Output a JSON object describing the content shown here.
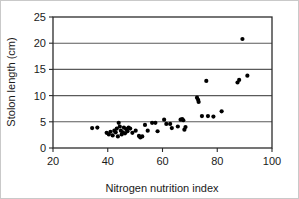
{
  "chart_data": {
    "type": "scatter",
    "title": "",
    "xlabel": "Nitrogen nutrition index",
    "ylabel": "Stolon length (cm)",
    "xlim": [
      20,
      100
    ],
    "ylim": [
      0,
      25
    ],
    "xticks": [
      20,
      40,
      60,
      80,
      100
    ],
    "yticks": [
      0,
      5,
      10,
      15,
      20,
      25
    ],
    "xtick_labels": [
      "20",
      "40",
      "60",
      "80",
      "100"
    ],
    "ytick_labels": [
      "0",
      "5",
      "10",
      "15",
      "20",
      "25"
    ],
    "grid": "horizontal",
    "gridlines_y": [
      5,
      10,
      15,
      20
    ],
    "legend": "none",
    "marker": "filled-circle",
    "marker_color": "#000000",
    "series": [
      {
        "name": "Stolon length vs nitrogen nutrition index",
        "points": [
          [
            34.3,
            3.8
          ],
          [
            36.2,
            3.9
          ],
          [
            39.6,
            2.9
          ],
          [
            40.4,
            2.6
          ],
          [
            41.0,
            3.1
          ],
          [
            41.8,
            2.4
          ],
          [
            42.4,
            3.3
          ],
          [
            42.9,
            3.0
          ],
          [
            43.3,
            3.7
          ],
          [
            43.7,
            2.2
          ],
          [
            44.0,
            4.8
          ],
          [
            44.4,
            4.1
          ],
          [
            44.8,
            3.3
          ],
          [
            45.1,
            2.6
          ],
          [
            45.5,
            3.0
          ],
          [
            45.9,
            3.9
          ],
          [
            46.3,
            2.8
          ],
          [
            46.8,
            3.6
          ],
          [
            47.2,
            3.2
          ],
          [
            47.6,
            3.9
          ],
          [
            48.2,
            3.7
          ],
          [
            49.0,
            2.9
          ],
          [
            50.2,
            3.3
          ],
          [
            51.4,
            2.3
          ],
          [
            51.9,
            2.0
          ],
          [
            52.6,
            2.2
          ],
          [
            53.6,
            4.4
          ],
          [
            54.6,
            3.3
          ],
          [
            56.2,
            4.8
          ],
          [
            57.4,
            4.8
          ],
          [
            58.2,
            3.2
          ],
          [
            60.6,
            5.4
          ],
          [
            61.4,
            4.6
          ],
          [
            62.8,
            4.6
          ],
          [
            63.4,
            3.8
          ],
          [
            65.6,
            4.1
          ],
          [
            66.6,
            5.4
          ],
          [
            67.2,
            5.5
          ],
          [
            67.6,
            5.3
          ],
          [
            68.0,
            3.5
          ],
          [
            68.4,
            4.0
          ],
          [
            72.6,
            9.6
          ],
          [
            73.0,
            9.2
          ],
          [
            73.2,
            8.8
          ],
          [
            74.4,
            6.1
          ],
          [
            76.0,
            12.8
          ],
          [
            76.6,
            6.1
          ],
          [
            78.6,
            6.0
          ],
          [
            81.6,
            7.0
          ],
          [
            87.4,
            12.5
          ],
          [
            88.0,
            13.0
          ],
          [
            89.2,
            20.8
          ],
          [
            91.0,
            13.8
          ]
        ]
      }
    ]
  },
  "axes": {
    "x_title": "Nitrogen nutrition index",
    "y_title": "Stolon length (cm)"
  }
}
